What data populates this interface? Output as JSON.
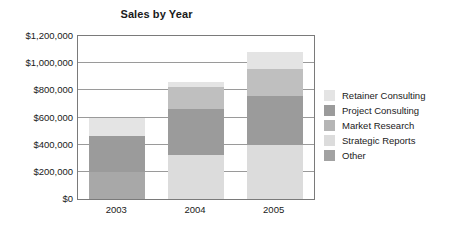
{
  "chart_data": {
    "type": "bar",
    "subtype": "stacked-column",
    "title": "Sales by Year",
    "xlabel": "",
    "ylabel": "",
    "categories": [
      "2003",
      "2004",
      "2005"
    ],
    "ylim": [
      0,
      1200000
    ],
    "y_tick_values": [
      0,
      200000,
      400000,
      600000,
      800000,
      1000000,
      1200000
    ],
    "y_tick_labels": [
      "$0",
      "$200,000",
      "$400,000",
      "$600,000",
      "$800,000",
      "$1,000,000",
      "$1,200,000"
    ],
    "grid": true,
    "legend_position": "right",
    "series": [
      {
        "name": "Other",
        "color": "#a8a8a8",
        "values": [
          200000,
          0,
          0
        ]
      },
      {
        "name": "Strategic Reports",
        "color": "#dcdcdc",
        "values": [
          0,
          325000,
          400000
        ]
      },
      {
        "name": "Market Research",
        "color": "#9b9b9b",
        "values": [
          265000,
          335000,
          360000
        ]
      },
      {
        "name": "Project Consulting",
        "color": "#bfbfbf",
        "values": [
          0,
          165000,
          195000
        ]
      },
      {
        "name": "Retainer Consulting",
        "color": "#e4e4e4",
        "values": [
          130000,
          40000,
          130000
        ]
      }
    ],
    "totals": [
      595000,
      865000,
      1085000
    ]
  },
  "legend": {
    "items": [
      {
        "label": "Retainer Consulting",
        "color": "#e4e4e4"
      },
      {
        "label": "Project Consulting",
        "color": "#9b9b9b"
      },
      {
        "label": "Market Research",
        "color": "#b5b5b5"
      },
      {
        "label": "Strategic Reports",
        "color": "#dcdcdc"
      },
      {
        "label": "Other",
        "color": "#a2a2a2"
      }
    ]
  },
  "style": {
    "plot_border_color": "#7a7a7a",
    "gridline_color": "#9a9a9a",
    "background": "#ffffff",
    "text_color": "#1a1a1a"
  }
}
